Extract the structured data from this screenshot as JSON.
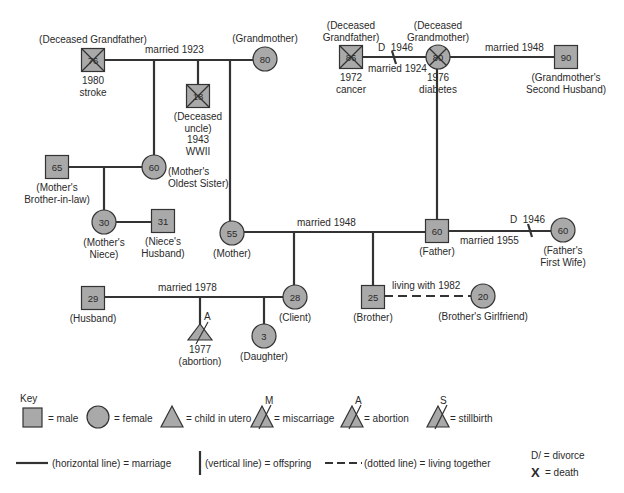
{
  "people": [
    {
      "id": "pgf",
      "shape": "square",
      "x": 93,
      "y": 60,
      "age": "76",
      "deceased": true,
      "label": [
        "(Deceased Grandfather)"
      ],
      "label_pos": "above",
      "sub": [
        "1980",
        "stroke"
      ]
    },
    {
      "id": "pgm",
      "shape": "circle",
      "x": 265,
      "y": 59,
      "age": "80",
      "deceased": false,
      "label": [
        "(Grandmother)"
      ],
      "label_pos": "above"
    },
    {
      "id": "uncle",
      "shape": "square",
      "x": 198,
      "y": 96,
      "age": "18",
      "deceased": true,
      "label": [
        "(Deceased",
        "uncle)",
        "1943",
        "WWII"
      ],
      "label_pos": "below"
    },
    {
      "id": "mgf",
      "shape": "square",
      "x": 351,
      "y": 57,
      "age": "86",
      "deceased": true,
      "label": [
        "(Deceased",
        "Grandfather)"
      ],
      "label_pos": "above2",
      "sub": [
        "1972",
        "cancer"
      ]
    },
    {
      "id": "mgm",
      "shape": "circle",
      "x": 438,
      "y": 57,
      "age": "80",
      "deceased": true,
      "label": [
        "(Deceased",
        "Grandmother)"
      ],
      "label_pos": "above2",
      "sub": [
        "1976",
        "diabetes"
      ]
    },
    {
      "id": "sh",
      "shape": "square",
      "x": 566,
      "y": 57,
      "age": "90",
      "deceased": false,
      "label": [
        "(Grandmother's",
        "Second Husband)"
      ],
      "label_pos": "below"
    },
    {
      "id": "bil",
      "shape": "square",
      "x": 57,
      "y": 167,
      "age": "65",
      "deceased": false,
      "label": [
        "(Mother's",
        "Brother-in-law)"
      ],
      "label_pos": "below"
    },
    {
      "id": "sis",
      "shape": "circle",
      "x": 154,
      "y": 167,
      "age": "60",
      "deceased": false,
      "label": [
        "(Mother's",
        "Oldest Sister)"
      ],
      "label_pos": "right"
    },
    {
      "id": "niece",
      "shape": "circle",
      "x": 104,
      "y": 222,
      "age": "30",
      "deceased": false,
      "label": [
        "(Mother's",
        "Niece)"
      ],
      "label_pos": "below"
    },
    {
      "id": "nh",
      "shape": "square",
      "x": 163,
      "y": 221,
      "age": "31",
      "deceased": false,
      "label": [
        "(Niece's",
        "Husband)"
      ],
      "label_pos": "below"
    },
    {
      "id": "mother",
      "shape": "circle",
      "x": 232,
      "y": 233,
      "age": "55",
      "deceased": false,
      "label": [
        "(Mother)"
      ],
      "label_pos": "below"
    },
    {
      "id": "father",
      "shape": "square",
      "x": 437,
      "y": 231,
      "age": "60",
      "deceased": false,
      "label": [
        "(Father)"
      ],
      "label_pos": "below"
    },
    {
      "id": "ffw",
      "shape": "circle",
      "x": 563,
      "y": 230,
      "age": "60",
      "deceased": false,
      "label": [
        "(Father's",
        "First Wife)"
      ],
      "label_pos": "below"
    },
    {
      "id": "husband",
      "shape": "square",
      "x": 93,
      "y": 298,
      "age": "29",
      "deceased": false,
      "label": [
        "(Husband)"
      ],
      "label_pos": "below"
    },
    {
      "id": "client",
      "shape": "circle",
      "x": 295,
      "y": 297,
      "age": "28",
      "deceased": false,
      "label": [
        "(Client)"
      ],
      "label_pos": "below"
    },
    {
      "id": "brother",
      "shape": "square",
      "x": 373,
      "y": 297,
      "age": "25",
      "deceased": false,
      "label": [
        "(Brother)"
      ],
      "label_pos": "below"
    },
    {
      "id": "gf",
      "shape": "circle",
      "x": 483,
      "y": 296,
      "age": "20",
      "deceased": false,
      "label": [
        "(Brother's Girlfriend)"
      ],
      "label_pos": "below"
    },
    {
      "id": "daughter",
      "shape": "circle",
      "x": 264,
      "y": 336,
      "age": "3",
      "deceased": false,
      "label": [
        "(Daughter)"
      ],
      "label_pos": "below"
    }
  ],
  "relationships": [
    {
      "type": "marriage",
      "label": "married 1923",
      "from": "pgf",
      "to": "pgm"
    },
    {
      "type": "marriage",
      "label": "married 1924",
      "divorce": "D  1946",
      "from": "mgf",
      "to": "mgm"
    },
    {
      "type": "marriage",
      "label": "married 1948",
      "from": "mgm",
      "to": "sh"
    },
    {
      "type": "marriage",
      "label": "",
      "from": "bil",
      "to": "sis"
    },
    {
      "type": "marriage",
      "label": "",
      "from": "niece",
      "to": "nh"
    },
    {
      "type": "marriage",
      "label": "married 1948",
      "from": "mother",
      "to": "father"
    },
    {
      "type": "marriage",
      "label": "married 1955",
      "divorce": "D  1946",
      "from": "father",
      "to": "ffw"
    },
    {
      "type": "marriage",
      "label": "married 1978",
      "from": "husband",
      "to": "client"
    },
    {
      "type": "living_together",
      "label": "living with 1982",
      "from": "brother",
      "to": "gf"
    }
  ],
  "fetus": {
    "mark": "A",
    "label": [
      "1977",
      "(abortion)"
    ]
  },
  "key": {
    "title": "Key",
    "row1": [
      {
        "symbol": "square",
        "text": "= male"
      },
      {
        "symbol": "circle",
        "text": "= female"
      },
      {
        "symbol": "triangle",
        "text": "= child in utero"
      },
      {
        "symbol": "triangle-x",
        "mark": "M",
        "text": "= miscarriage"
      },
      {
        "symbol": "triangle-x",
        "mark": "A",
        "text": "= abortion"
      },
      {
        "symbol": "triangle-x",
        "mark": "S",
        "text": "= stillbirth"
      }
    ],
    "row2": [
      {
        "symbol": "hline",
        "text": "(horizontal line) = marriage"
      },
      {
        "symbol": "vline",
        "text": "(vertical line) = offspring"
      },
      {
        "symbol": "dashline",
        "text": "(dotted line) = living together"
      }
    ],
    "divorce": "D/ = divorce",
    "death_symbol": "X",
    "death": "= death"
  },
  "colors": {
    "shape_fill": "#a9a9a9",
    "line": "#333333"
  }
}
